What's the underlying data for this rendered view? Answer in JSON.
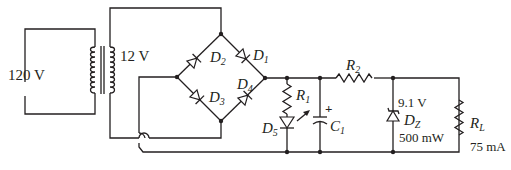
{
  "diagram": {
    "colors": {
      "ink": "#231f20",
      "background": "#ffffff"
    },
    "source": {
      "label": "120 V"
    },
    "transformer": {
      "secondary_label": "12 V"
    },
    "bridge": {
      "diodes": [
        {
          "id": "D1",
          "base": "D",
          "sub": "1"
        },
        {
          "id": "D2",
          "base": "D",
          "sub": "2"
        },
        {
          "id": "D3",
          "base": "D",
          "sub": "3"
        },
        {
          "id": "D4",
          "base": "D",
          "sub": "4"
        }
      ]
    },
    "indicator": {
      "resistor": {
        "base": "R",
        "sub": "1"
      },
      "led": {
        "base": "D",
        "sub": "5"
      }
    },
    "filter": {
      "capacitor": {
        "base": "C",
        "sub": "1",
        "polarity": "+"
      }
    },
    "series_resistor": {
      "base": "R",
      "sub": "2"
    },
    "zener": {
      "base": "D",
      "sub": "Z",
      "voltage": "9.1 V",
      "power": "500 mW"
    },
    "load": {
      "base": "R",
      "sub": "L",
      "current": "75 mA"
    }
  }
}
